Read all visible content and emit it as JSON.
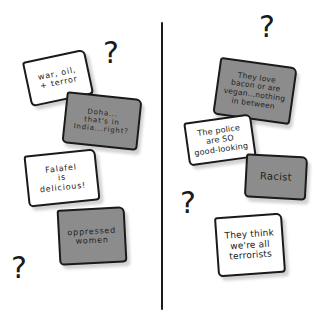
{
  "colors": {
    "note_white": "#ffffff",
    "note_gray": "#8c8c8c",
    "ink": "#1a1a1a"
  },
  "left_panel": {
    "notes": [
      {
        "text": "war, oil,\n+ terror",
        "color": "white"
      },
      {
        "text": "Doha...\nthat's in\nIndia...right?",
        "color": "gray"
      },
      {
        "text": "Falafel\nis\ndelicious!",
        "color": "white"
      },
      {
        "text": "oppressed\nwomen",
        "color": "gray"
      }
    ],
    "question_marks": [
      "?",
      "?"
    ]
  },
  "right_panel": {
    "notes": [
      {
        "text": "They love\nbacon or are\nvegan...nothing\nin between",
        "color": "gray"
      },
      {
        "text": "The police\nare SO\ngood-looking",
        "color": "white"
      },
      {
        "text": "Racist",
        "color": "gray"
      },
      {
        "text": "They think\nwe're all\nterrorists",
        "color": "white"
      }
    ],
    "question_marks": [
      "?",
      "?"
    ]
  }
}
